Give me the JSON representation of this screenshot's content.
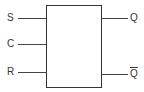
{
  "diagram": {
    "block": {
      "type": "rectangle"
    },
    "inputs": [
      {
        "label": "S"
      },
      {
        "label": "C"
      },
      {
        "label": "R"
      }
    ],
    "outputs": [
      {
        "label": "Q"
      },
      {
        "label": "Q"
      }
    ],
    "colors": {
      "line": "#444444",
      "text": "#333333",
      "background": "#ffffff"
    }
  }
}
